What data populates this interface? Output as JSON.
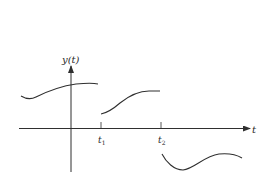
{
  "diagram": {
    "type": "piecewise signal plot",
    "colors": {
      "stroke": "#2f2f2f",
      "background": "#ffffff"
    },
    "y_axis": {
      "label": "y(t)"
    },
    "x_axis": {
      "label": "t"
    },
    "ticks": [
      {
        "name": "t1",
        "base": "t",
        "subscript": "1"
      },
      {
        "name": "t2",
        "base": "t",
        "subscript": "2"
      }
    ],
    "segments": [
      {
        "name": "segment-before-t1",
        "description": "positive curve, slight dip then rising, ends just before t1"
      },
      {
        "name": "segment-t1-to-t2",
        "description": "positive curve starting lower at t1, rising and leveling near t2"
      },
      {
        "name": "segment-after-t2",
        "description": "negative curve after t2, dipping then rising"
      }
    ]
  }
}
